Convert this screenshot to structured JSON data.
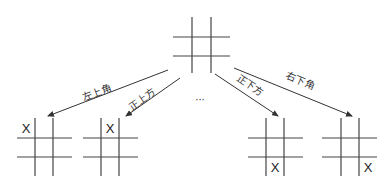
{
  "diagram": {
    "type": "tic-tac-toe game tree",
    "root": {
      "grid": {
        "x1": 173,
        "x2": 230,
        "y1": 17,
        "y2": 73,
        "v": [
          192,
          211
        ],
        "h": [
          37,
          56
        ]
      },
      "mark": null
    },
    "children": [
      {
        "label": "左上角",
        "mark": "X",
        "cell": [
          0,
          0
        ],
        "grid": {
          "x1": 17,
          "x2": 72,
          "y1": 118,
          "y2": 176,
          "v": [
            35,
            53
          ],
          "h": [
            138,
            157
          ]
        },
        "arrow": {
          "x1": 168,
          "y1": 70,
          "x2": 48,
          "y2": 116
        },
        "label_pos": {
          "x": 98,
          "y": 96,
          "angle": -21
        }
      },
      {
        "label": "正上方",
        "mark": "X",
        "cell": [
          0,
          1
        ],
        "grid": {
          "x1": 83,
          "x2": 138,
          "y1": 118,
          "y2": 176,
          "v": [
            101,
            119
          ],
          "h": [
            138,
            157
          ]
        },
        "arrow": {
          "x1": 180,
          "y1": 78,
          "x2": 126,
          "y2": 116
        },
        "label_pos": {
          "x": 144,
          "y": 102,
          "angle": -35
        }
      },
      {
        "label": "正下方",
        "mark": "X",
        "cell": [
          2,
          1
        ],
        "grid": {
          "x1": 248,
          "x2": 303,
          "y1": 118,
          "y2": 176,
          "v": [
            266,
            284
          ],
          "h": [
            138,
            157
          ]
        },
        "arrow": {
          "x1": 215,
          "y1": 74,
          "x2": 278,
          "y2": 116
        },
        "label_pos": {
          "x": 248,
          "y": 88,
          "angle": 34
        }
      },
      {
        "label": "右下角",
        "mark": "X",
        "cell": [
          2,
          2
        ],
        "grid": {
          "x1": 322,
          "x2": 377,
          "y1": 118,
          "y2": 176,
          "v": [
            341,
            359
          ],
          "h": [
            138,
            157
          ]
        },
        "arrow": {
          "x1": 234,
          "y1": 68,
          "x2": 352,
          "y2": 116
        },
        "label_pos": {
          "x": 299,
          "y": 84,
          "angle": 22
        }
      }
    ],
    "ellipsis": {
      "text": "···",
      "x": 200,
      "y": 103
    },
    "colors": {
      "line": "#444444",
      "arrow": "#333333",
      "text": "#333333"
    }
  }
}
